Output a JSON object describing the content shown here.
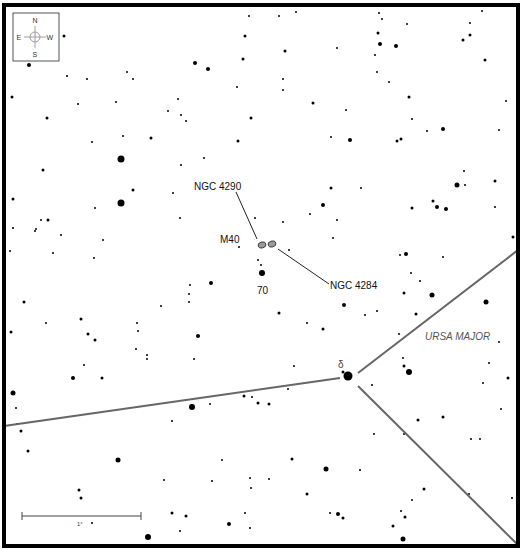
{
  "chart": {
    "frame": {
      "x": 4,
      "y": 5,
      "w": 513,
      "h": 267,
      "stroke": "#000000",
      "stroke_width": 4
    },
    "frame_bottom": 273
  },
  "compass": {
    "box": {
      "x": 13,
      "y": 13,
      "w": 46,
      "h": 48
    },
    "labels": {
      "north": "N",
      "south": "S",
      "east": "E",
      "west": "W"
    }
  },
  "labels": {
    "ngc4290": "NGC 4290",
    "ngc4284": "NGC 4284",
    "m40": "M40",
    "star70": "70",
    "delta": "δ",
    "constellation": "URSA MAJOR"
  },
  "scale_bar": {
    "label": "1°",
    "x1": 22,
    "x2": 141,
    "y": 516
  },
  "galaxies": [
    {
      "name": "NGC 4290",
      "cx": 262,
      "cy": 245,
      "rx": 4,
      "ry": 3,
      "fill": "#999999"
    },
    {
      "name": "NGC 4284",
      "cx": 272,
      "cy": 244,
      "rx": 4,
      "ry": 3,
      "fill": "#999999"
    }
  ],
  "leader_lines": [
    {
      "x1": 236,
      "y1": 192,
      "x2": 257,
      "y2": 239
    },
    {
      "x1": 278,
      "y1": 249,
      "x2": 329,
      "y2": 284
    }
  ],
  "boundaries": [
    {
      "points": "4,426 340,378"
    },
    {
      "points": "358,373 518,250"
    },
    {
      "points": "358,386 518,545"
    }
  ],
  "boundary_color": "#666666",
  "stars": [
    [
      64,
      36,
      1.5
    ],
    [
      249,
      16,
      1
    ],
    [
      279,
      16,
      1
    ],
    [
      296,
      12,
      1
    ],
    [
      379,
      13,
      1
    ],
    [
      382,
      19,
      1
    ],
    [
      407,
      24,
      1
    ],
    [
      470,
      23,
      1
    ],
    [
      482,
      11,
      1
    ],
    [
      245,
      36,
      1.5
    ],
    [
      285,
      51,
      1.5
    ],
    [
      337,
      48,
      1
    ],
    [
      378,
      33,
      1.5
    ],
    [
      380,
      44,
      2
    ],
    [
      396,
      46,
      2
    ],
    [
      463,
      40,
      1.5
    ],
    [
      470,
      35,
      1.5
    ],
    [
      29,
      65,
      2
    ],
    [
      195,
      63,
      2
    ],
    [
      208,
      69,
      2
    ],
    [
      243,
      59,
      1.5
    ],
    [
      375,
      55,
      1
    ],
    [
      485,
      60,
      1.5
    ],
    [
      67,
      76,
      1
    ],
    [
      87,
      79,
      1
    ],
    [
      127,
      72,
      1
    ],
    [
      133,
      79,
      1
    ],
    [
      237,
      87,
      1
    ],
    [
      283,
      79,
      1
    ],
    [
      283,
      90,
      1
    ],
    [
      377,
      72,
      1
    ],
    [
      389,
      82,
      1
    ],
    [
      12,
      97,
      1.5
    ],
    [
      78,
      104,
      1
    ],
    [
      116,
      102,
      1
    ],
    [
      178,
      99,
      1
    ],
    [
      168,
      111,
      1
    ],
    [
      181,
      115,
      1
    ],
    [
      186,
      121,
      1
    ],
    [
      313,
      103,
      1.5
    ],
    [
      346,
      110,
      1
    ],
    [
      409,
      97,
      1.5
    ],
    [
      412,
      119,
      1
    ],
    [
      506,
      101,
      1
    ],
    [
      47,
      118,
      1.5
    ],
    [
      251,
      118,
      1.5
    ],
    [
      123,
      136,
      1
    ],
    [
      151,
      138,
      1.5
    ],
    [
      92,
      142,
      1
    ],
    [
      238,
      141,
      1.5
    ],
    [
      331,
      137,
      1
    ],
    [
      350,
      140,
      2
    ],
    [
      397,
      141,
      1.5
    ],
    [
      401,
      139,
      1.5
    ],
    [
      427,
      131,
      1
    ],
    [
      443,
      129,
      2
    ],
    [
      499,
      130,
      1
    ],
    [
      121,
      159,
      3.5
    ],
    [
      181,
      165,
      1
    ],
    [
      204,
      158,
      1
    ],
    [
      43,
      170,
      1.5
    ],
    [
      464,
      171,
      1
    ],
    [
      457,
      185,
      2.5
    ],
    [
      465,
      185,
      1
    ],
    [
      495,
      181,
      1.5
    ],
    [
      121,
      203,
      3.5
    ],
    [
      133,
      190,
      1.5
    ],
    [
      173,
      193,
      1
    ],
    [
      331,
      188,
      1.5
    ],
    [
      361,
      188,
      1
    ],
    [
      95,
      208,
      1
    ],
    [
      323,
      205,
      2
    ],
    [
      433,
      201,
      1.5
    ],
    [
      437,
      207,
      2
    ],
    [
      446,
      209,
      2
    ],
    [
      412,
      208,
      1.5
    ],
    [
      495,
      207,
      1
    ],
    [
      13,
      199,
      1.5
    ],
    [
      41,
      220,
      1
    ],
    [
      48,
      220,
      1.5
    ],
    [
      180,
      218,
      1
    ],
    [
      255,
      218,
      1
    ],
    [
      283,
      222,
      1
    ],
    [
      310,
      214,
      1
    ],
    [
      337,
      220,
      1
    ],
    [
      13,
      228,
      1
    ],
    [
      36,
      229,
      1
    ],
    [
      35,
      231,
      1
    ],
    [
      61,
      235,
      1
    ],
    [
      103,
      240,
      1
    ],
    [
      10,
      251,
      1
    ],
    [
      53,
      253,
      1
    ],
    [
      94,
      258,
      1
    ],
    [
      239,
      247,
      1
    ],
    [
      289,
      250,
      1
    ],
    [
      333,
      238,
      1
    ],
    [
      400,
      255,
      1
    ],
    [
      406,
      254,
      2
    ],
    [
      443,
      257,
      1
    ],
    [
      513,
      237,
      1.5
    ],
    [
      258,
      260,
      1
    ],
    [
      261,
      265,
      1
    ],
    [
      262,
      273,
      3
    ],
    [
      211,
      283,
      2
    ],
    [
      190,
      285,
      1
    ],
    [
      189,
      294,
      1
    ],
    [
      189,
      302,
      1
    ],
    [
      24,
      302,
      1.5
    ],
    [
      46,
      323,
      1
    ],
    [
      81,
      319,
      1.5
    ],
    [
      88,
      334,
      1.5
    ],
    [
      95,
      340,
      1.5
    ],
    [
      137,
      323,
      1
    ],
    [
      138,
      331,
      1
    ],
    [
      136,
      349,
      1
    ],
    [
      147,
      355,
      1
    ],
    [
      147,
      359,
      1
    ],
    [
      161,
      306,
      1
    ],
    [
      198,
      336,
      2
    ],
    [
      194,
      359,
      1
    ],
    [
      279,
      313,
      1.5
    ],
    [
      307,
      323,
      1
    ],
    [
      323,
      329,
      1.5
    ],
    [
      344,
      305,
      2
    ],
    [
      365,
      315,
      1
    ],
    [
      377,
      311,
      1
    ],
    [
      404,
      293,
      1.5
    ],
    [
      420,
      281,
      1
    ],
    [
      411,
      273,
      1
    ],
    [
      432,
      295,
      2.5
    ],
    [
      486,
      302,
      2.5
    ],
    [
      416,
      314,
      1.5
    ],
    [
      11,
      332,
      1.5
    ],
    [
      84,
      365,
      1
    ],
    [
      102,
      378,
      1.5
    ],
    [
      73,
      378,
      2
    ],
    [
      294,
      366,
      1
    ],
    [
      343,
      372,
      1.5
    ],
    [
      399,
      334,
      1
    ],
    [
      403,
      358,
      1
    ],
    [
      404,
      366,
      1.5
    ],
    [
      409,
      372,
      3
    ],
    [
      372,
      385,
      1
    ],
    [
      483,
      383,
      1
    ],
    [
      489,
      363,
      1
    ],
    [
      499,
      342,
      1
    ],
    [
      508,
      378,
      1.5
    ],
    [
      13,
      393,
      2.5
    ],
    [
      16,
      408,
      1
    ],
    [
      17,
      424,
      1
    ],
    [
      21,
      431,
      1.5
    ],
    [
      28,
      451,
      1.5
    ],
    [
      118,
      460,
      2.5
    ],
    [
      192,
      407,
      3
    ],
    [
      210,
      404,
      1
    ],
    [
      244,
      396,
      1.5
    ],
    [
      252,
      397,
      1
    ],
    [
      258,
      403,
      1.5
    ],
    [
      269,
      404,
      1.5
    ],
    [
      288,
      389,
      1
    ],
    [
      172,
      421,
      1
    ],
    [
      222,
      460,
      1
    ],
    [
      292,
      459,
      1.5
    ],
    [
      326,
      469,
      2.5
    ],
    [
      360,
      470,
      1
    ],
    [
      374,
      434,
      1
    ],
    [
      404,
      434,
      1
    ],
    [
      418,
      420,
      1.5
    ],
    [
      443,
      417,
      1.5
    ],
    [
      471,
      439,
      1
    ],
    [
      480,
      439,
      1
    ],
    [
      501,
      409,
      1
    ],
    [
      164,
      480,
      1
    ],
    [
      212,
      481,
      1
    ],
    [
      250,
      478,
      1
    ],
    [
      251,
      488,
      1
    ],
    [
      269,
      479,
      1
    ],
    [
      79,
      490,
      1.5
    ],
    [
      81,
      498,
      1.5
    ],
    [
      307,
      494,
      1.5
    ],
    [
      172,
      513,
      1.5
    ],
    [
      186,
      516,
      1.5
    ],
    [
      245,
      513,
      1
    ],
    [
      229,
      524,
      2
    ],
    [
      250,
      528,
      1
    ],
    [
      180,
      531,
      1
    ],
    [
      330,
      513,
      1
    ],
    [
      338,
      514,
      2
    ],
    [
      343,
      518,
      1.5
    ],
    [
      401,
      511,
      1
    ],
    [
      405,
      517,
      1.5
    ],
    [
      412,
      500,
      1
    ],
    [
      424,
      489,
      1.5
    ],
    [
      469,
      494,
      1
    ],
    [
      512,
      498,
      1
    ],
    [
      393,
      526,
      1.5
    ],
    [
      403,
      539,
      2.5
    ],
    [
      148,
      537,
      3
    ],
    [
      92,
      523,
      1
    ]
  ]
}
